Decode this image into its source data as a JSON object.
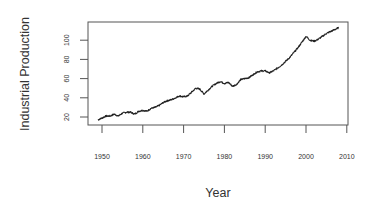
{
  "chart_data": {
    "type": "line",
    "title": "",
    "xlabel": "Year",
    "ylabel": "Industrial Production",
    "xlim": [
      1947.5,
      2011
    ],
    "ylim": [
      12,
      120
    ],
    "x_ticks": [
      1950,
      1960,
      1970,
      1980,
      1990,
      2000,
      2010
    ],
    "y_ticks": [
      20,
      40,
      60,
      80,
      100
    ],
    "grid": false,
    "legend": null,
    "series": [
      {
        "name": "Industrial Production",
        "color": "#222222",
        "x": [
          1949,
          1950,
          1951,
          1952,
          1953,
          1954,
          1955,
          1956,
          1957,
          1958,
          1959,
          1960,
          1961,
          1962,
          1963,
          1964,
          1965,
          1966,
          1967,
          1968,
          1969,
          1970,
          1971,
          1972,
          1973,
          1974,
          1975,
          1976,
          1977,
          1978,
          1979,
          1980,
          1981,
          1982,
          1983,
          1984,
          1985,
          1986,
          1987,
          1988,
          1989,
          1990,
          1991,
          1992,
          1993,
          1994,
          1995,
          1996,
          1997,
          1998,
          1999,
          2000,
          2001,
          2002,
          2003,
          2004,
          2005,
          2006,
          2007,
          2008
        ],
        "values": [
          17,
          19,
          21,
          21,
          23,
          21,
          24,
          25,
          25,
          23,
          26,
          27,
          26,
          29,
          30,
          32,
          35,
          37,
          38,
          40,
          42,
          41,
          42,
          46,
          50,
          49,
          44,
          48,
          52,
          55,
          57,
          55,
          56,
          52,
          54,
          59,
          60,
          61,
          64,
          67,
          68,
          68,
          66,
          68,
          71,
          74,
          78,
          82,
          87,
          92,
          98,
          104,
          100,
          99,
          101,
          104,
          107,
          109,
          111,
          113
        ]
      }
    ]
  },
  "labels": {
    "xlabel": "Year",
    "ylabel": "Industrial Production"
  }
}
